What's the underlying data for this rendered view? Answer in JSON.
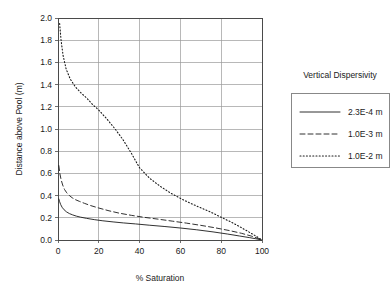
{
  "chart_data": {
    "type": "line",
    "title": "",
    "xlabel": "% Saturation",
    "ylabel": "Distance above Pool (m)",
    "xlim": [
      0,
      100
    ],
    "ylim": [
      0,
      2.0
    ],
    "xticks": [
      "0",
      "20",
      "40",
      "60",
      "80",
      "100"
    ],
    "xtick_values": [
      0,
      20,
      40,
      60,
      80,
      100
    ],
    "yticks": [
      "0.0",
      "0.2",
      "0.4",
      "0.6",
      "0.8",
      "1.0",
      "1.2",
      "1.4",
      "1.6",
      "1.8",
      "2.0"
    ],
    "ytick_values": [
      0.0,
      0.2,
      0.4,
      0.6,
      0.8,
      1.0,
      1.2,
      1.4,
      1.6,
      1.8,
      2.0
    ],
    "grid": true,
    "legend_position": "right",
    "legend_title": "Vertical Dispersivity",
    "series": [
      {
        "name": "2.3E-4 m",
        "style": "solid",
        "color": "#1a1a1a",
        "x": [
          0.4,
          0.8,
          1.3,
          2.0,
          3.0,
          4.2,
          5.6,
          7.2,
          9.0,
          11.0,
          14.0,
          18.0,
          22.0,
          27.0,
          32.0,
          38.0,
          45.0,
          52.0,
          60.0,
          68.0,
          76.0,
          83.0,
          89.0,
          94.0,
          97.0,
          99.0,
          100.0
        ],
        "y": [
          0.37,
          0.345,
          0.32,
          0.295,
          0.272,
          0.253,
          0.238,
          0.226,
          0.215,
          0.206,
          0.195,
          0.183,
          0.173,
          0.163,
          0.154,
          0.145,
          0.133,
          0.122,
          0.108,
          0.092,
          0.073,
          0.054,
          0.036,
          0.021,
          0.011,
          0.004,
          0.0
        ]
      },
      {
        "name": "1.0E-3 m",
        "style": "dashed",
        "color": "#1a1a1a",
        "x": [
          0.4,
          0.9,
          1.5,
          2.3,
          3.2,
          4.3,
          5.6,
          7.0,
          8.6,
          10.5,
          13.0,
          16.0,
          20.0,
          25.0,
          30.0,
          36.0,
          42.0,
          49.0,
          56.0,
          63.0,
          70.0,
          77.0,
          84.0,
          90.0,
          95.0,
          98.0,
          100.0
        ],
        "y": [
          0.67,
          0.6,
          0.545,
          0.495,
          0.455,
          0.425,
          0.4,
          0.38,
          0.363,
          0.348,
          0.33,
          0.31,
          0.288,
          0.263,
          0.242,
          0.222,
          0.205,
          0.188,
          0.17,
          0.152,
          0.132,
          0.11,
          0.085,
          0.06,
          0.034,
          0.014,
          0.0
        ]
      },
      {
        "name": "1.0E-2 m",
        "style": "dotted",
        "color": "#1a1a1a",
        "x": [
          0.8,
          1.5,
          2.5,
          4.0,
          6.0,
          8.5,
          11.0,
          14.0,
          17.0,
          20.0,
          24.0,
          28.0,
          32.0,
          36.0,
          40.0,
          45.0,
          50.0,
          55.0,
          60.0,
          65.0,
          70.0,
          75.0,
          80.0,
          85.0,
          90.0,
          94.0,
          97.0,
          99.0,
          100.0
        ],
        "y": [
          1.95,
          1.8,
          1.66,
          1.54,
          1.45,
          1.38,
          1.33,
          1.28,
          1.22,
          1.17,
          1.09,
          1.0,
          0.9,
          0.78,
          0.65,
          0.555,
          0.485,
          0.425,
          0.375,
          0.33,
          0.29,
          0.25,
          0.205,
          0.16,
          0.11,
          0.068,
          0.035,
          0.012,
          0.0
        ]
      }
    ]
  },
  "legend": {
    "title": "Vertical Dispersivity",
    "entries": [
      {
        "label": "2.3E-4 m",
        "style": "solid"
      },
      {
        "label": "1.0E-3 m",
        "style": "dashed"
      },
      {
        "label": "1.0E-2 m",
        "style": "dotted"
      }
    ]
  },
  "axes": {
    "x_title": "% Saturation",
    "y_title": "Distance above Pool (m)"
  }
}
